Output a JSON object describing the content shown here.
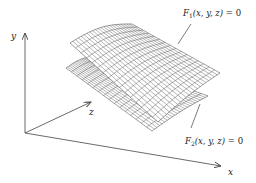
{
  "diagram": {
    "type": "3d-surface-intersection",
    "axes": {
      "x": {
        "label": "x"
      },
      "y": {
        "label": "y"
      },
      "z": {
        "label": "z"
      }
    },
    "surfaces": [
      {
        "id": "F1",
        "name": "F",
        "subscript": "1",
        "args": "(x, y, z)",
        "equation_suffix": " = 0",
        "full_text": "F1(x, y, z) = 0",
        "position": "upper"
      },
      {
        "id": "F2",
        "name": "F",
        "subscript": "2",
        "args": "(x, y, z)",
        "equation_suffix": " = 0",
        "full_text": "F2(x, y, z) = 0",
        "position": "lower"
      }
    ],
    "colors": {
      "line": "#444444",
      "grid": "#555555",
      "surface_fill": "#ffffff",
      "background": "#ffffff"
    }
  }
}
